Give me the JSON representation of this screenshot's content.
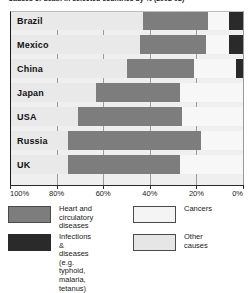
{
  "chart_data": {
    "type": "bar",
    "subtype": "stacked-horizontal-100pct",
    "title": "Causes of death in selected countries by % (2002-02)",
    "categories": [
      "Brazil",
      "Mexico",
      "China",
      "Japan",
      "USA",
      "Russia",
      "UK"
    ],
    "series": [
      {
        "name": "Heart and circulatory diseases",
        "color": "#7d7d7d",
        "values": [
          28,
          28,
          29,
          36,
          45,
          57,
          48
        ]
      },
      {
        "name": "Cancers",
        "color": "#f7f7f7",
        "values": [
          9,
          10,
          18,
          27,
          26,
          18,
          27
        ]
      },
      {
        "name": "Infections & diseases (e.g. typhoid, malaria, tetanus)",
        "color": "#2a2a2a",
        "values": [
          6,
          6,
          3,
          0,
          0,
          0,
          0
        ]
      },
      {
        "name": "Other causes",
        "color": "#e9e9e9",
        "values": [
          57,
          56,
          50,
          37,
          29,
          25,
          25
        ]
      }
    ],
    "xlabel": "",
    "ylabel": "",
    "xlim": [
      100,
      0
    ],
    "axis_reversed": true,
    "tick_labels": [
      "100%",
      "80%",
      "60%",
      "40%",
      "20%",
      "0%"
    ],
    "tick_values": [
      100,
      80,
      60,
      40,
      20,
      0
    ],
    "grid": true,
    "legend_position": "bottom"
  },
  "legend": {
    "heart": "Heart and\ncirculatory diseases",
    "cancers": "Cancers",
    "infections": "Infections & diseases\n(e.g. typhoid, malaria,\ntetanus)",
    "other": "Other\ncauses"
  }
}
